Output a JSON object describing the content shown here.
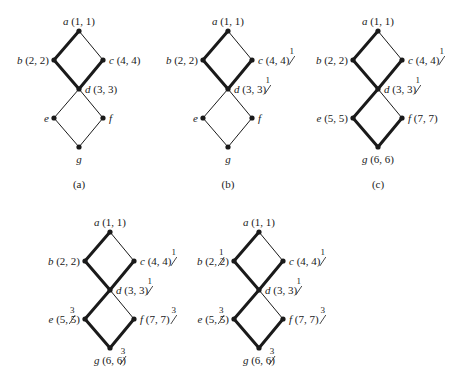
{
  "panels": [
    {
      "id": "a",
      "caption": "(a)",
      "origin": [
        79,
        31
      ],
      "nodes": {
        "a": {
          "name": "a",
          "label": " (1, 1)",
          "pos": "top"
        },
        "b": {
          "name": "b",
          "label": " (2, 2)",
          "pos": "left"
        },
        "c": {
          "name": "c",
          "label": " (4, 4)",
          "pos": "right"
        },
        "d": {
          "name": "d",
          "label": " (3, 3)",
          "pos": "right"
        },
        "e": {
          "name": "e",
          "label": "",
          "pos": "left"
        },
        "f": {
          "name": "f",
          "label": "",
          "pos": "right"
        },
        "g": {
          "name": "g",
          "label": "",
          "pos": "bottom"
        }
      },
      "thick_edges": [
        "a-b",
        "b-d",
        "c-d"
      ],
      "thin_edges": [
        "a-c",
        "d-e",
        "d-f",
        "e-g",
        "f-g"
      ],
      "strikes": {}
    },
    {
      "id": "b",
      "caption": "(b)",
      "origin": [
        228,
        31
      ],
      "nodes": {
        "a": {
          "name": "a",
          "label": " (1, 1)",
          "pos": "top"
        },
        "b": {
          "name": "b",
          "label": " (2, 2)",
          "pos": "left"
        },
        "c": {
          "name": "c",
          "label": " (4, 4)",
          "pos": "right"
        },
        "d": {
          "name": "d",
          "label": " (3, 3)",
          "pos": "right"
        },
        "e": {
          "name": "e",
          "label": "",
          "pos": "left"
        },
        "f": {
          "name": "f",
          "label": "",
          "pos": "right"
        },
        "g": {
          "name": "g",
          "label": "",
          "pos": "bottom"
        }
      },
      "thick_edges": [
        "a-b",
        "b-d",
        "c-d"
      ],
      "thin_edges": [
        "a-c",
        "d-e",
        "d-f",
        "e-g",
        "f-g"
      ],
      "strikes": {
        "c": "1",
        "d": "1"
      }
    },
    {
      "id": "c",
      "caption": "(c)",
      "origin": [
        378,
        31
      ],
      "nodes": {
        "a": {
          "name": "a",
          "label": " (1, 1)",
          "pos": "top"
        },
        "b": {
          "name": "b",
          "label": " (2, 2)",
          "pos": "left"
        },
        "c": {
          "name": "c",
          "label": " (4, 4)",
          "pos": "right"
        },
        "d": {
          "name": "d",
          "label": " (3, 3)",
          "pos": "right"
        },
        "e": {
          "name": "e",
          "label": " (5, 5)",
          "pos": "left"
        },
        "f": {
          "name": "f",
          "label": " (7, 7)",
          "pos": "right"
        },
        "g": {
          "name": "g",
          "label": " (6, 6)",
          "pos": "bottom"
        }
      },
      "thick_edges": [
        "a-b",
        "b-d",
        "c-d",
        "d-e",
        "e-g",
        "f-g"
      ],
      "thin_edges": [
        "a-c",
        "d-f"
      ],
      "strikes": {
        "c": "1",
        "d": "1"
      }
    },
    {
      "id": "d",
      "caption": "",
      "origin": [
        110,
        232
      ],
      "nodes": {
        "a": {
          "name": "a",
          "label": " (1, 1)",
          "pos": "top"
        },
        "b": {
          "name": "b",
          "label": " (2, 2)",
          "pos": "left"
        },
        "c": {
          "name": "c",
          "label": " (4, 4)",
          "pos": "right"
        },
        "d": {
          "name": "d",
          "label": " (3, 3)",
          "pos": "right"
        },
        "e": {
          "name": "e",
          "label": " (5, 5)",
          "pos": "left"
        },
        "f": {
          "name": "f",
          "label": " (7, 7)",
          "pos": "right"
        },
        "g": {
          "name": "g",
          "label": " (6, 6)",
          "pos": "bottom"
        }
      },
      "thick_edges": [
        "a-b",
        "b-d",
        "c-d",
        "d-e",
        "e-g",
        "f-g"
      ],
      "thin_edges": [
        "a-c",
        "d-f"
      ],
      "strikes": {
        "c": "1",
        "d": "1",
        "e": "3",
        "f": "3",
        "g": "3"
      }
    },
    {
      "id": "e",
      "caption": "",
      "origin": [
        259,
        232
      ],
      "nodes": {
        "a": {
          "name": "a",
          "label": " (1, 1)",
          "pos": "top"
        },
        "b": {
          "name": "b",
          "label": " (2, 2)",
          "pos": "left"
        },
        "c": {
          "name": "c",
          "label": " (4, 4)",
          "pos": "right"
        },
        "d": {
          "name": "d",
          "label": " (3, 3)",
          "pos": "right"
        },
        "e": {
          "name": "e",
          "label": " (5, 5)",
          "pos": "left"
        },
        "f": {
          "name": "f",
          "label": " (7, 7)",
          "pos": "right"
        },
        "g": {
          "name": "g",
          "label": " (6, 6)",
          "pos": "bottom"
        }
      },
      "thick_edges": [
        "a-b",
        "b-d",
        "c-d",
        "d-e",
        "e-g",
        "f-g"
      ],
      "thin_edges": [
        "a-c",
        "d-f"
      ],
      "strikes": {
        "b": "1",
        "c": "1",
        "d": "1",
        "e": "3",
        "f": "3",
        "g": "3"
      }
    }
  ],
  "colors": {
    "ink": "#1a1a1a",
    "background": "#ffffff"
  }
}
